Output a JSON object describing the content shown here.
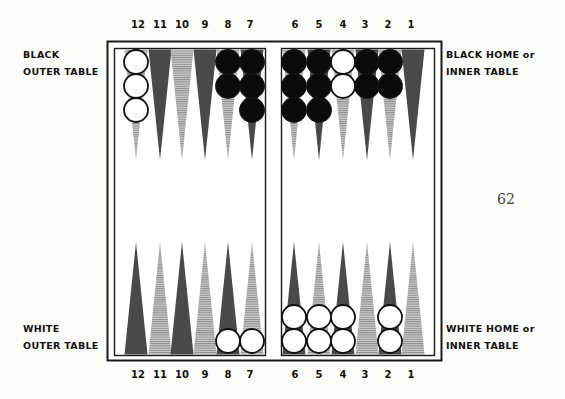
{
  "page_number": "62",
  "labels": {
    "black_outer": [
      "BLACK",
      "OUTER TABLE"
    ],
    "black_home": [
      "BLACK HOME or",
      "INNER TABLE"
    ],
    "white_outer": [
      "WHITE",
      "OUTER TABLE"
    ],
    "white_home": [
      "WHITE HOME or",
      "INNER TABLE"
    ]
  },
  "point_numbers": {
    "left": [
      "12",
      "11",
      "10",
      "9",
      "8",
      "7"
    ],
    "right": [
      "6",
      "5",
      "4",
      "3",
      "2",
      "1"
    ]
  },
  "colors": {
    "dark_point": "#4a4a4a",
    "light_point": "#b5b5b5",
    "black_checker": "#0a0a0a",
    "white_checker": "#ffffff",
    "border": "#1a1a1a"
  },
  "board": {
    "top_points": [
      {
        "point": "12",
        "color": "light",
        "checkers": {
          "color": "white",
          "count": 3
        }
      },
      {
        "point": "11",
        "color": "dark",
        "checkers": {
          "color": "none",
          "count": 0
        }
      },
      {
        "point": "10",
        "color": "light",
        "checkers": {
          "color": "none",
          "count": 0
        }
      },
      {
        "point": "9",
        "color": "dark",
        "checkers": {
          "color": "none",
          "count": 0
        }
      },
      {
        "point": "8",
        "color": "light",
        "checkers": {
          "color": "black",
          "count": 2
        }
      },
      {
        "point": "7",
        "color": "dark",
        "checkers": {
          "color": "black",
          "count": 3
        }
      },
      {
        "point": "6",
        "color": "light",
        "checkers": {
          "color": "black",
          "count": 3
        }
      },
      {
        "point": "5",
        "color": "dark",
        "checkers": {
          "color": "black",
          "count": 3
        }
      },
      {
        "point": "4",
        "color": "light",
        "checkers": {
          "color": "white",
          "count": 2
        }
      },
      {
        "point": "3",
        "color": "dark",
        "checkers": {
          "color": "black",
          "count": 2
        }
      },
      {
        "point": "2",
        "color": "light",
        "checkers": {
          "color": "black",
          "count": 2
        }
      },
      {
        "point": "1",
        "color": "dark",
        "checkers": {
          "color": "none",
          "count": 0
        }
      }
    ],
    "bottom_points": [
      {
        "point": "12",
        "color": "dark",
        "checkers": {
          "color": "none",
          "count": 0
        }
      },
      {
        "point": "11",
        "color": "light",
        "checkers": {
          "color": "none",
          "count": 0
        }
      },
      {
        "point": "10",
        "color": "dark",
        "checkers": {
          "color": "none",
          "count": 0
        }
      },
      {
        "point": "9",
        "color": "light",
        "checkers": {
          "color": "none",
          "count": 0
        }
      },
      {
        "point": "8",
        "color": "dark",
        "checkers": {
          "color": "white",
          "count": 1
        }
      },
      {
        "point": "7",
        "color": "light",
        "checkers": {
          "color": "white",
          "count": 1
        }
      },
      {
        "point": "6",
        "color": "dark",
        "checkers": {
          "color": "white",
          "count": 2
        }
      },
      {
        "point": "5",
        "color": "light",
        "checkers": {
          "color": "white",
          "count": 2
        }
      },
      {
        "point": "4",
        "color": "dark",
        "checkers": {
          "color": "white",
          "count": 2
        }
      },
      {
        "point": "3",
        "color": "light",
        "checkers": {
          "color": "none",
          "count": 0
        }
      },
      {
        "point": "2",
        "color": "dark",
        "checkers": {
          "color": "white",
          "count": 2
        }
      },
      {
        "point": "1",
        "color": "light",
        "checkers": {
          "color": "none",
          "count": 0
        }
      }
    ]
  }
}
